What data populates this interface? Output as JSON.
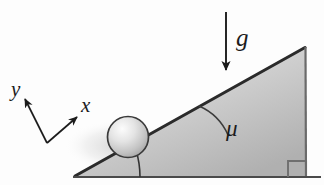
{
  "figure": {
    "background_color": "#fdfdfd",
    "width": 324,
    "height": 185
  },
  "labels": {
    "gravity": "g",
    "friction_angle": "μ",
    "axis_x": "x",
    "axis_y": "y"
  },
  "colors": {
    "ink": "#1c1c1c",
    "incline_edge": "#2b2b2b",
    "incline_fill_light": "#e3e3e3",
    "incline_fill_dark": "#b4b4b4",
    "ball_outline": "#3a3a3a",
    "ball_highlight": "#fbfbfb",
    "ball_shade": "#9a9a9a",
    "ground_line": "#4a4a4a",
    "arc_stroke": "#3c3c3c"
  },
  "geometry": {
    "incline_apex": {
      "x": 305,
      "y": 48
    },
    "incline_left_vertex": {
      "x": 75,
      "y": 176
    },
    "incline_bottom_right": {
      "x": 306,
      "y": 176
    },
    "incline_angle_degrees": 26,
    "ball_center": {
      "x": 128,
      "y": 137
    },
    "ball_radius": 20,
    "gravity_arrow": {
      "x": 226,
      "y_start": 12,
      "y_end": 72
    },
    "right_angle_marker": {
      "x": 288,
      "y": 159,
      "size": 16
    }
  },
  "elements": {
    "gravity_arrow_name": "gravity-arrow",
    "incline_name": "inclined-plane",
    "ball_name": "ball",
    "axes_name": "coordinate-axes",
    "angle_arc_name": "incline-angle-arc",
    "right_angle_name": "right-angle-marker",
    "ground_name": "ground-line"
  }
}
